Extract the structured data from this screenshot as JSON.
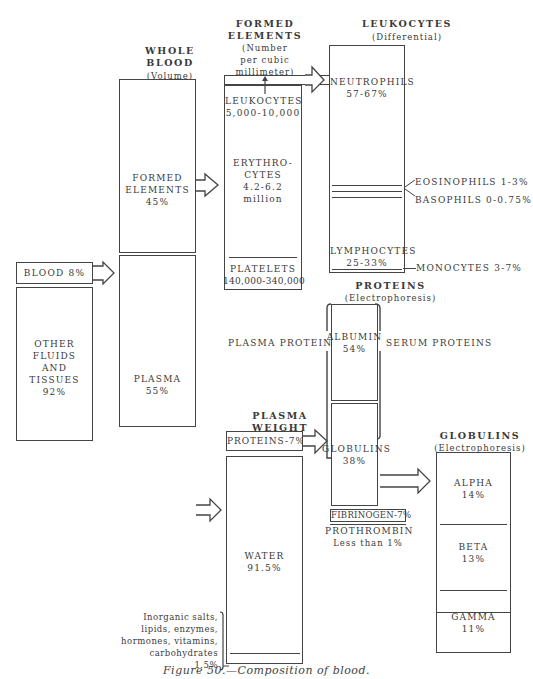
{
  "figure": {
    "caption": "Figure 50.—Composition of blood."
  },
  "columns": {
    "whole_blood": {
      "title": "WHOLE BLOOD",
      "subtitle": "(Volume)"
    },
    "formed_elements": {
      "title": "FORMED ELEMENTS",
      "subtitle": "(Number per cubic millimeter)"
    },
    "leukocytes": {
      "title": "LEUKOCYTES",
      "subtitle": "(Differential)"
    },
    "proteins": {
      "title": "PROTEINS",
      "subtitle": "(Electrophoresis)"
    },
    "plasma_weight": {
      "title": "PLASMA WEIGHT"
    },
    "globulins": {
      "title": "GLOBULINS",
      "subtitle": "(Electrophoresis)"
    }
  },
  "body": {
    "blood": {
      "label": "BLOOD 8%"
    },
    "other": {
      "line1": "OTHER",
      "line2": "FLUIDS",
      "line3": "AND",
      "line4": "TISSUES",
      "value": "92%"
    }
  },
  "whole_blood": {
    "formed": {
      "line1": "FORMED",
      "line2": "ELEMENTS",
      "value": "45%"
    },
    "plasma": {
      "label": "PLASMA",
      "value": "55%"
    }
  },
  "formed_elements": {
    "leukocytes": {
      "label": "LEUKOCYTES",
      "value": "5,000-10,000"
    },
    "erythrocytes": {
      "line1": "ERYTHRO-",
      "line2": "CYTES",
      "value": "4.2-6.2",
      "unit": "million"
    },
    "platelets": {
      "label": "PLATELETS",
      "value": "140,000-340,000"
    }
  },
  "leukocytes": {
    "neutrophils": {
      "label": "NEUTROPHILS",
      "value": "57-67%"
    },
    "eosinophils": {
      "label": "EOSINOPHILS 1-3%"
    },
    "basophils": {
      "label": "BASOPHILS 0-0.75%"
    },
    "lymphocytes": {
      "label": "LYMPHOCYTES",
      "value": "25-33%"
    },
    "monocytes": {
      "label": "MONOCYTES 3-7%"
    }
  },
  "plasma_weight": {
    "proteins": {
      "label": "PROTEINS-7%"
    },
    "water": {
      "label": "WATER",
      "value": "91.5%"
    },
    "other": {
      "line1": "Inorganic salts,",
      "line2": "lipids, enzymes,",
      "line3": "hormones, vitamins,",
      "line4": "carbohydrates",
      "value": "1.5%"
    }
  },
  "proteins": {
    "plasma_proteins_label": "PLASMA PROTEINS",
    "serum_proteins_label": "SERUM PROTEINS",
    "albumin": {
      "label": "ALBUMIN",
      "value": "54%"
    },
    "globulins": {
      "label": "GLOBULINS",
      "value": "38%"
    },
    "fibrinogen": {
      "label": "FIBRINOGEN-7%"
    },
    "prothrombin": {
      "label": "PROTHROMBIN",
      "value": "Less than 1%"
    }
  },
  "globulins": {
    "alpha": {
      "label": "ALPHA",
      "value": "14%"
    },
    "beta": {
      "label": "BETA",
      "value": "13%"
    },
    "gamma": {
      "label": "GAMMA",
      "value": "11%"
    }
  }
}
